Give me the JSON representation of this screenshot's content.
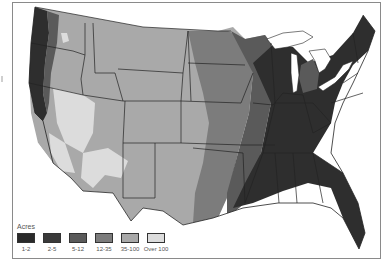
{
  "map": {
    "subject": "Contiguous United States shaded by acreage class",
    "colors": {
      "c1_2": "#2a2a2a",
      "c2_5": "#3a3a3a",
      "c5_12": "#5a5a5a",
      "c12_35": "#7c7c7c",
      "c35_100": "#a9a9a9",
      "over100": "#dcdcdc",
      "water": "#ffffff",
      "border": "#222222"
    }
  },
  "legend": {
    "title": "Acres",
    "items": [
      {
        "label": "1-2",
        "color": "#2a2a2a"
      },
      {
        "label": "2-5",
        "color": "#3a3a3a"
      },
      {
        "label": "5-12",
        "color": "#5a5a5a"
      },
      {
        "label": "12-35",
        "color": "#7c7c7c"
      },
      {
        "label": "35-100",
        "color": "#a9a9a9"
      },
      {
        "label": "Over 100",
        "color": "#dcdcdc"
      }
    ]
  }
}
